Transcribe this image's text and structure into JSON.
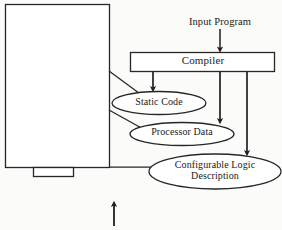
{
  "figure": {
    "background_color": "#fbfbfa",
    "ink_color": "#1f1f1f",
    "type": "block-flow-diagram"
  },
  "nodes": {
    "input_program": {
      "label": "Input Program",
      "shape": "text-label"
    },
    "compiler": {
      "label": "Compiler",
      "shape": "rectangle"
    },
    "static_code": {
      "label": "Static Code",
      "shape": "ellipse"
    },
    "processor_data": {
      "label": "Processor Data",
      "shape": "ellipse"
    },
    "configurable_logic": {
      "label": "Configurable Logic Description",
      "label_line_1": "Configurable Logic",
      "label_line_2": "Description",
      "shape": "ellipse"
    },
    "device_block": {
      "label": "",
      "shape": "rectangle-with-tab"
    }
  },
  "edges": [
    {
      "from": "input_program",
      "to": "compiler",
      "arrow": true
    },
    {
      "from": "compiler",
      "to": "static_code",
      "arrow": true
    },
    {
      "from": "compiler",
      "to": "processor_data",
      "arrow": true
    },
    {
      "from": "compiler",
      "to": "configurable_logic",
      "arrow": true
    },
    {
      "from": "device_block",
      "to": "static_code",
      "arrow": false
    },
    {
      "from": "device_block",
      "to": "processor_data",
      "arrow": false
    },
    {
      "from": "device_block",
      "to": "configurable_logic",
      "arrow": false
    }
  ],
  "annotations": {
    "bottom_caption": "",
    "bottom_arrow": {
      "direction": "up",
      "visible": true
    }
  }
}
